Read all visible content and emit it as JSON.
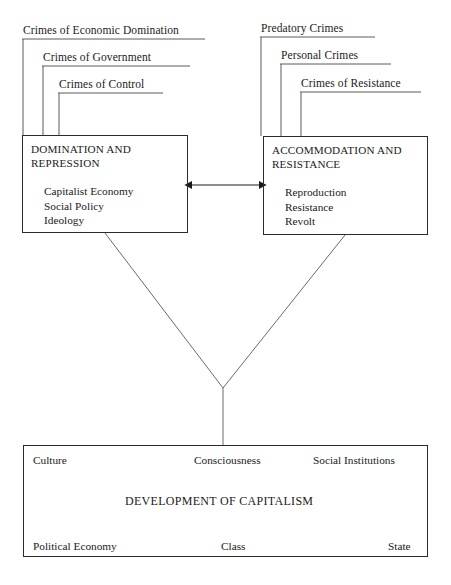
{
  "diagram": {
    "stroke_color": "#4a4a4a",
    "box_border_color": "#2b2b2b",
    "text_color": "#1a1a1a",
    "background": "#ffffff"
  },
  "left_branch": {
    "labels": [
      {
        "text": "Crimes of Economic Domination"
      },
      {
        "text": "Crimes of Government"
      },
      {
        "text": "Crimes of Control"
      }
    ],
    "box": {
      "title": "DOMINATION AND\nREPRESSION",
      "items": [
        "Capitalist Economy",
        "Social Policy",
        "Ideology"
      ]
    }
  },
  "right_branch": {
    "labels": [
      {
        "text": "Predatory Crimes"
      },
      {
        "text": "Personal Crimes"
      },
      {
        "text": "Crimes of Resistance"
      }
    ],
    "box": {
      "title": "ACCOMMODATION AND\nRESISTANCE",
      "items": [
        "Reproduction",
        "Resistance",
        "Revolt"
      ]
    }
  },
  "connector": {
    "arrow_name": "double-headed-arrow"
  },
  "base": {
    "top_row": [
      "Culture",
      "Consciousness",
      "Social Institutions"
    ],
    "center_title": "DEVELOPMENT OF CAPITALISM",
    "bottom_row": [
      "Political Economy",
      "Class",
      "State"
    ]
  }
}
